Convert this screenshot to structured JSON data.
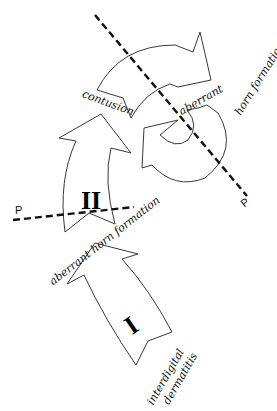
{
  "diagram": {
    "stages": [
      {
        "numeral": "I",
        "label_line1": "interdigital",
        "label_line2": "dermatitis"
      },
      {
        "numeral": "II",
        "label": "aberrant horn formation"
      }
    ],
    "cycle": {
      "labels": [
        "contusion",
        "aberrant",
        "horn formation"
      ]
    },
    "planes": [
      {
        "label": "P"
      },
      {
        "label": "P"
      }
    ]
  }
}
